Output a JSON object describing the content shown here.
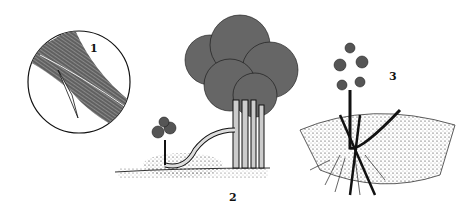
{
  "illustration": {
    "panels": [
      {
        "id": 1,
        "label": "1",
        "subject": "magnified stem with slanted cut (tongue)"
      },
      {
        "id": 2,
        "label": "2",
        "subject": "shrub with low branch bent into soil mound beside a new shoot"
      },
      {
        "id": 3,
        "label": "3",
        "subject": "layered shoot pegged in soil with roots forming"
      }
    ],
    "colors": {
      "ink": "#111111",
      "background": "#ffffff",
      "shade": "#777777"
    }
  }
}
